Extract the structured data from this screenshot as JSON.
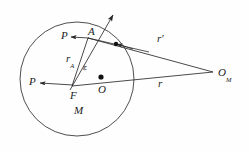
{
  "figure": {
    "type": "geometry-diagram",
    "background_color": "#fefefe",
    "stroke_color": "#2a2a2a",
    "label_color": "#1a1a1a"
  },
  "shapes": {
    "circle": {
      "name": "body-circle",
      "cx": 77,
      "cy": 79,
      "r": 57,
      "fill": "none",
      "stroke": "#3a3a3a",
      "stroke_width": 0.9
    },
    "center_dot": {
      "name": "center-point-O",
      "cx": 101,
      "cy": 77,
      "r": 2.6,
      "fill": "#111111"
    },
    "node_dot": {
      "name": "intersection-point",
      "cx": 116,
      "cy": 44,
      "r": 2.2,
      "fill": "#111111"
    }
  },
  "lines": {
    "ray_through_F": {
      "name": "ray-from-F-upward",
      "x1": 72,
      "y1": 86,
      "x2": 114,
      "y2": 14,
      "arrow": "end"
    },
    "radius_rA": {
      "name": "radius-segment-rA",
      "x1": 72,
      "y1": 86,
      "x2": 88,
      "y2": 38
    },
    "line_rprime": {
      "name": "vector-r-prime",
      "x1": 88,
      "y1": 38,
      "x2": 213,
      "y2": 72
    },
    "line_r": {
      "name": "vector-r",
      "x1": 72,
      "y1": 86,
      "x2": 213,
      "y2": 72
    },
    "arrow_P_upper": {
      "name": "P-arrow-upper",
      "x1": 90,
      "y1": 38,
      "x2": 72,
      "y2": 37,
      "arrow": "end"
    },
    "arrow_P_lower": {
      "name": "P-arrow-lower",
      "x1": 72,
      "y1": 85,
      "x2": 40,
      "y2": 83,
      "arrow": "end"
    },
    "arrow_toward_A": {
      "name": "arrowhead-toward-A",
      "x1": 130,
      "y1": 48,
      "x2": 116,
      "y2": 44,
      "arrow": "end"
    }
  },
  "labels": {
    "p_upper": {
      "text": "P",
      "x": 61,
      "y": 30
    },
    "p_lower": {
      "text": "P",
      "x": 29,
      "y": 76
    },
    "point_a": {
      "text": "A",
      "x": 88,
      "y": 28
    },
    "radius_a_base": {
      "text": "r",
      "x": 66,
      "y": 50
    },
    "radius_a_sub": {
      "text": "A"
    },
    "epsilon": {
      "text": "ε",
      "x": 83,
      "y": 65
    },
    "point_f": {
      "text": "F",
      "x": 71,
      "y": 91
    },
    "point_o": {
      "text": "O",
      "x": 99,
      "y": 85
    },
    "vector_r_prime": {
      "text": "r′",
      "x": 157,
      "y": 35
    },
    "vector_r": {
      "text": "r",
      "x": 157,
      "y": 79
    },
    "body_m": {
      "text": "M",
      "x": 75,
      "y": 107
    },
    "o_m_base": {
      "text": "O",
      "x": 219,
      "y": 64
    },
    "o_m_sub": {
      "text": "M"
    }
  }
}
